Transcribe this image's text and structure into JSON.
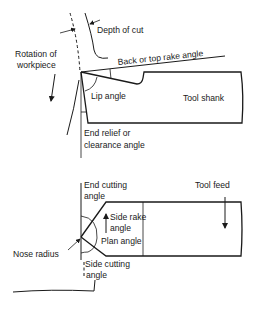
{
  "diagram": {
    "side_view": {
      "labels": {
        "depth_of_cut": "Depth of cut",
        "rotation": [
          "Rotation of",
          "workpiece"
        ],
        "back_rake": "Back or top rake angle",
        "lip_angle": "Lip angle",
        "tool_shank": "Tool shank",
        "end_relief": [
          "End relief or",
          "clearance angle"
        ]
      }
    },
    "plan_view": {
      "labels": {
        "end_cutting": [
          "End cutting",
          "angle"
        ],
        "tool_feed": "Tool feed",
        "side_rake": [
          "Side rake",
          "angle"
        ],
        "plan_angle": "Plan angle",
        "nose_radius": "Nose radius",
        "side_cutting": [
          "Side cutting",
          "angle"
        ]
      }
    },
    "colors": {
      "line": "#1a1a1a",
      "background": "#ffffff"
    }
  }
}
